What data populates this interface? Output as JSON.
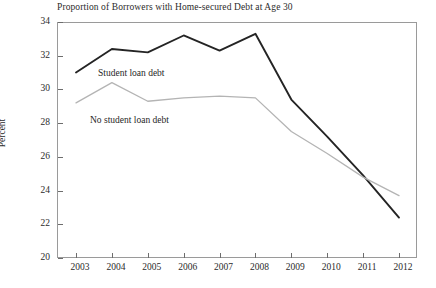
{
  "chart_data": {
    "type": "line",
    "title": "Proportion of Borrowers with Home-secured Debt at Age 30",
    "xlabel": "",
    "ylabel": "Percent",
    "x": [
      2003,
      2004,
      2005,
      2006,
      2007,
      2008,
      2009,
      2010,
      2011,
      2012
    ],
    "categories": [
      "2003",
      "2004",
      "2005",
      "2006",
      "2007",
      "2008",
      "2009",
      "2010",
      "2011",
      "2012"
    ],
    "xlim": [
      2003,
      2012
    ],
    "ylim": [
      20,
      34
    ],
    "yticks": [
      20,
      22,
      24,
      26,
      28,
      30,
      32,
      34
    ],
    "ytick_labels": [
      "20",
      "22",
      "24",
      "26",
      "28",
      "30",
      "32",
      "34"
    ],
    "grid": false,
    "legend_position": "inline-annotation",
    "series": [
      {
        "name": "Student loan debt",
        "color": "#242424",
        "width": 1.9,
        "values": [
          31.0,
          32.4,
          32.2,
          33.2,
          32.3,
          33.3,
          29.4,
          27.2,
          24.9,
          22.4
        ]
      },
      {
        "name": "No student loan debt",
        "color": "#b4b4b4",
        "width": 1.3,
        "values": [
          29.2,
          30.4,
          29.3,
          29.5,
          29.6,
          29.5,
          27.5,
          26.2,
          24.8,
          23.7
        ]
      }
    ],
    "annotations": [
      {
        "text": "Student loan debt",
        "series": "Student loan debt"
      },
      {
        "text": "No student loan debt",
        "series": "No student loan debt"
      }
    ]
  },
  "axes": {
    "y_label": "Percent",
    "y_ticks": [
      "34",
      "32",
      "30",
      "28",
      "26",
      "24",
      "22",
      "20"
    ],
    "x_ticks": [
      "2003",
      "2004",
      "2005",
      "2006",
      "2007",
      "2008",
      "2009",
      "2010",
      "2011",
      "2012"
    ]
  },
  "colors": {
    "student_loan_line": "#242424",
    "no_student_loan_line": "#b4b4b4",
    "frame": "#9a9a9a",
    "text": "#2b2b2b",
    "background": "#ffffff"
  }
}
